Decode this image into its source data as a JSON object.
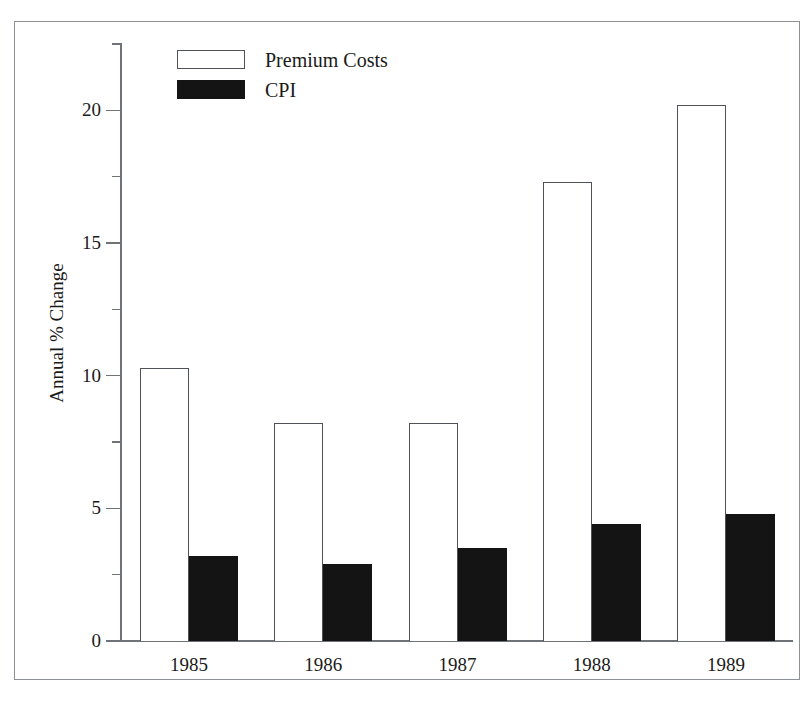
{
  "figure": {
    "cropped_title_fragment": "",
    "frame_color": "#8d9096"
  },
  "legend": {
    "position": "top-left-inside",
    "entries": [
      {
        "label": "Premium Costs",
        "swatch": "white-outlined-rect",
        "color": "#ffffff"
      },
      {
        "label": "CPI",
        "swatch": "solid-black-rect",
        "color": "#141414"
      }
    ]
  },
  "axes": {
    "y_title": "Annual % Change",
    "y_major_ticks": [
      "0",
      "5",
      "10",
      "15",
      "20"
    ],
    "y_minor_tick_values": [
      2.5,
      7.5,
      12.5,
      17.5,
      22.5
    ],
    "x_labels": [
      "1985",
      "1986",
      "1987",
      "1988",
      "1989"
    ]
  },
  "chart_data": {
    "type": "bar",
    "title": "",
    "subtitle": "",
    "xlabel": "",
    "ylabel": "Annual % Change",
    "categories": [
      "1985",
      "1986",
      "1987",
      "1988",
      "1989"
    ],
    "series": [
      {
        "name": "Premium Costs",
        "color": "#ffffff",
        "values": [
          10.3,
          8.2,
          8.2,
          17.3,
          20.2
        ]
      },
      {
        "name": "CPI",
        "color": "#141414",
        "values": [
          3.2,
          2.9,
          3.5,
          4.4,
          4.8
        ]
      }
    ],
    "ylim": [
      0,
      22.5
    ],
    "yticks": [
      0,
      5,
      10,
      15,
      20
    ],
    "yminorticks": [
      2.5,
      7.5,
      12.5,
      17.5,
      22.5
    ],
    "grid": false,
    "legend_position": "upper left"
  }
}
